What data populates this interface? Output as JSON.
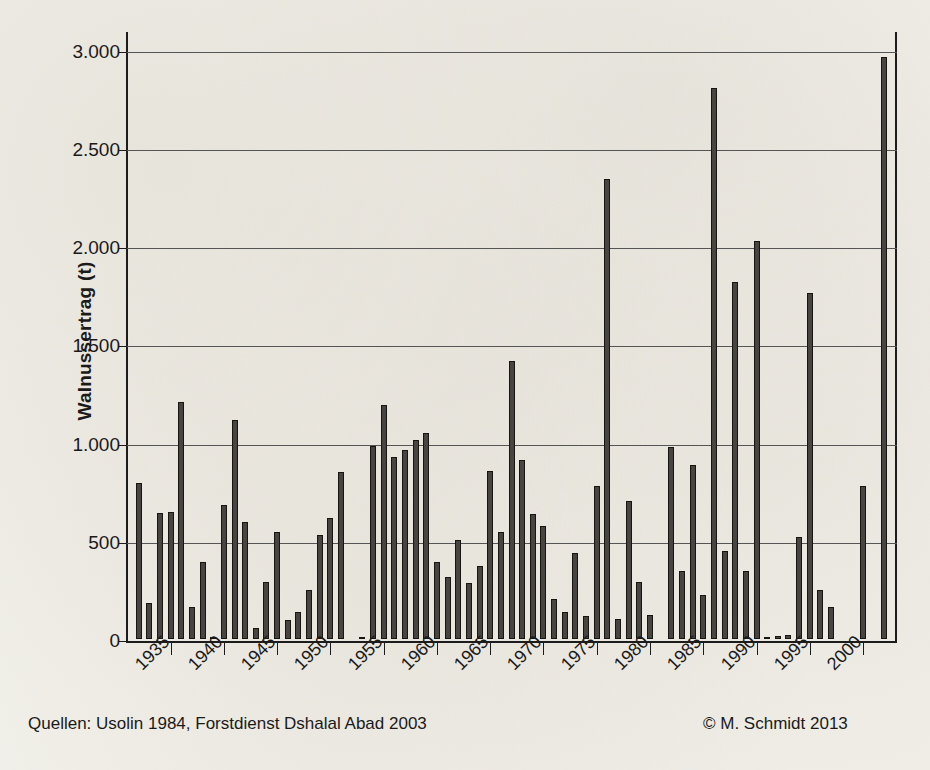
{
  "figure": {
    "source_note": "Quellen: Usolin 1984, Forstdienst Dshalal Abad 2003",
    "credit": "© M. Schmidt 2013"
  },
  "chart_data": {
    "type": "bar",
    "title": "",
    "xlabel": "",
    "ylabel": "Walnussertrag (t)",
    "ylim": [
      0,
      3100
    ],
    "xlim": [
      1931,
      2003
    ],
    "grid": true,
    "legend": "none",
    "ytick_labels": [
      "0",
      "500",
      "1.000",
      "1.500",
      "2.000",
      "2.500",
      "3.000"
    ],
    "ytick_values": [
      0,
      500,
      1000,
      1500,
      2000,
      2500,
      3000
    ],
    "xtick_labels": [
      "1935",
      "1940",
      "1945",
      "1950",
      "1955",
      "1960",
      "1965",
      "1970",
      "1975",
      "1980",
      "1985",
      "1990",
      "1995",
      "2000"
    ],
    "xtick_values": [
      1935,
      1940,
      1945,
      1950,
      1955,
      1960,
      1965,
      1970,
      1975,
      1980,
      1985,
      1990,
      1995,
      2000
    ],
    "bar_color": "#474442",
    "categories": [
      1932,
      1933,
      1934,
      1935,
      1936,
      1937,
      1938,
      1939,
      1940,
      1941,
      1942,
      1943,
      1944,
      1945,
      1946,
      1947,
      1948,
      1949,
      1950,
      1951,
      1952,
      1953,
      1954,
      1955,
      1956,
      1957,
      1958,
      1959,
      1960,
      1961,
      1962,
      1963,
      1964,
      1965,
      1966,
      1967,
      1968,
      1969,
      1970,
      1971,
      1972,
      1973,
      1974,
      1975,
      1976,
      1977,
      1978,
      1979,
      1980,
      1981,
      1982,
      1983,
      1984,
      1985,
      1986,
      1987,
      1988,
      1989,
      1990,
      1991,
      1992,
      1993,
      1994,
      1995,
      1996,
      1997,
      1998,
      1999,
      2000,
      2001,
      2002
    ],
    "values": [
      795,
      185,
      640,
      645,
      1205,
      165,
      390,
      10,
      680,
      1115,
      595,
      55,
      290,
      545,
      95,
      135,
      250,
      530,
      615,
      850,
      0,
      10,
      985,
      1190,
      925,
      960,
      1015,
      1050,
      390,
      315,
      505,
      285,
      370,
      855,
      545,
      1415,
      910,
      635,
      575,
      205,
      135,
      440,
      115,
      780,
      2340,
      100,
      700,
      290,
      120,
      0,
      975,
      345,
      885,
      225,
      2805,
      450,
      1815,
      345,
      2025,
      10,
      15,
      20,
      520,
      1760,
      250,
      165,
      0,
      0,
      780,
      0,
      2965
    ]
  }
}
